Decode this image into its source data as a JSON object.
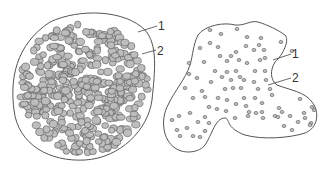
{
  "figure": {
    "left_panel": {
      "description": "dense cluster of many cells filling a rounded boundary",
      "labels": [
        {
          "text": "1",
          "target": "outer boundary"
        },
        {
          "text": "2",
          "target": "cell"
        }
      ]
    },
    "right_panel": {
      "description": "irregular lobed boundary with sparsely scattered small cells",
      "labels": [
        {
          "text": "1",
          "target": "outer boundary"
        },
        {
          "text": "2",
          "target": "cell"
        }
      ]
    },
    "colors": {
      "stroke": "#555555",
      "cell_fill": "#bdbdbd",
      "background": "#ffffff"
    }
  }
}
